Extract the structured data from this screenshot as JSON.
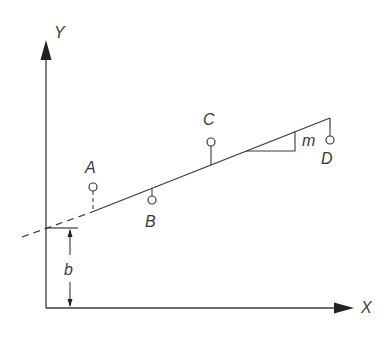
{
  "diagram": {
    "title": "",
    "axes": {
      "x_label": "X",
      "y_label": "Y"
    },
    "line": {
      "intercept_label": "b",
      "slope_label": "m"
    },
    "points": [
      {
        "label": "A",
        "position": "above line"
      },
      {
        "label": "B",
        "position": "below line"
      },
      {
        "label": "C",
        "position": "above line"
      },
      {
        "label": "D",
        "position": "below line"
      }
    ],
    "colors": {
      "stroke": "#3a3a3a",
      "background": "#ffffff"
    }
  }
}
